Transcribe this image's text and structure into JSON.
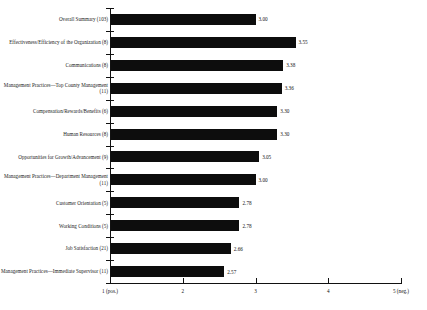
{
  "chart_data": {
    "type": "bar",
    "orientation": "horizontal",
    "title": "",
    "subtitle": "",
    "xlabel": "",
    "ylabel": "",
    "xlim": [
      1,
      5
    ],
    "grid": false,
    "legend": null,
    "scale_note": "1 = positive, 5 = negative",
    "axis_ticks": [
      {
        "value": 1,
        "label": "1 (pos.)"
      },
      {
        "value": 2,
        "label": "2"
      },
      {
        "value": 3,
        "label": "3"
      },
      {
        "value": 4,
        "label": "4"
      },
      {
        "value": 5,
        "label": "5 (neg.)"
      }
    ],
    "categories": [
      "Overall Summary (103)",
      "Effectiveness/Efficiency of the Organization (8)",
      "Communications (8)",
      "Management Practices—Top County Management (11)",
      "Compensation/Rewards/Benefits (6)",
      "Human Resources (8)",
      "Opportunities for Growth/Advancement (9)",
      "Management Practices—Department Management (11)",
      "Customer Orientation (5)",
      "Working Conditions (5)",
      "Job Satisfaction (21)",
      "Management Practices—Immediate Supervisor (11)"
    ],
    "values": [
      3.0,
      3.55,
      3.38,
      3.36,
      3.3,
      3.3,
      3.05,
      3.0,
      2.78,
      2.78,
      2.66,
      2.57
    ],
    "value_labels": [
      "3.00",
      "3.55",
      "3.38",
      "3.36",
      "3.30",
      "3.30",
      "3.05",
      "3.00",
      "2.78",
      "2.78",
      "2.66",
      "2.57"
    ],
    "bar_color": "#0d0d0d"
  },
  "rows": [
    {
      "label": "Overall Summary (103)",
      "value_label": "3.00"
    },
    {
      "label": "Effectiveness/Efficiency of the Organization (8)",
      "value_label": "3.55"
    },
    {
      "label": "Communications (8)",
      "value_label": "3.38"
    },
    {
      "label": "Management Practices—Top County Management (11)",
      "value_label": "3.36"
    },
    {
      "label": "Compensation/Rewards/Benefits (6)",
      "value_label": "3.30"
    },
    {
      "label": "Human Resources (8)",
      "value_label": "3.30"
    },
    {
      "label": "Opportunities for Growth/Advancement (9)",
      "value_label": "3.05"
    },
    {
      "label": "Management Practices—Department Management (11)",
      "value_label": "3.00"
    },
    {
      "label": "Customer Orientation (5)",
      "value_label": "2.78"
    },
    {
      "label": "Working Conditions (5)",
      "value_label": "2.78"
    },
    {
      "label": "Job Satisfaction (21)",
      "value_label": "2.66"
    },
    {
      "label": "Management Practices—Immediate Supervisor (11)",
      "value_label": "2.57"
    }
  ],
  "x_axis": {
    "ticks": [
      "1 (pos.)",
      "2",
      "3",
      "4",
      "5 (neg.)"
    ]
  }
}
